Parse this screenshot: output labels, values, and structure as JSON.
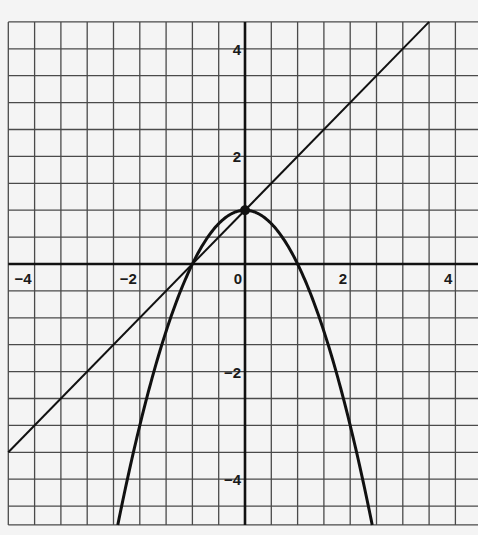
{
  "chart_data": {
    "type": "line",
    "title": "",
    "xlabel": "",
    "ylabel": "",
    "xlim": [
      -4.5,
      4.45
    ],
    "ylim": [
      -4.85,
      4.5
    ],
    "grid": true,
    "grid_step": 0.5,
    "x_tick_labels": [
      {
        "value": -4,
        "label": "−4"
      },
      {
        "value": -2,
        "label": "−2"
      },
      {
        "value": 0,
        "label": "0"
      },
      {
        "value": 2,
        "label": "2"
      },
      {
        "value": 4,
        "label": "4"
      }
    ],
    "y_tick_labels": [
      {
        "value": 4,
        "label": "4"
      },
      {
        "value": 2,
        "label": "2"
      },
      {
        "value": -2,
        "label": "−2"
      },
      {
        "value": -4,
        "label": "−4"
      }
    ],
    "series": [
      {
        "name": "parabola",
        "equation": "y = 1 - x^2",
        "kind": "curve",
        "vertex": [
          0,
          1
        ],
        "x_intercepts": [
          -1,
          1
        ]
      },
      {
        "name": "line",
        "equation": "y = x + 1",
        "kind": "line",
        "points": [
          [
            -4.5,
            -3.5
          ],
          [
            3.5,
            4.5
          ]
        ]
      }
    ],
    "points": [
      {
        "name": "intersection-point",
        "x": 0,
        "y": 1,
        "marker": "filled-dot"
      },
      {
        "name": "intersection-point",
        "x": -1,
        "y": 0,
        "marker": "none"
      }
    ],
    "legend": null
  },
  "colors": {
    "background": "#f4f4f4",
    "grid": "#4a4a4a",
    "axis": "#111111",
    "curve": "#111111"
  }
}
